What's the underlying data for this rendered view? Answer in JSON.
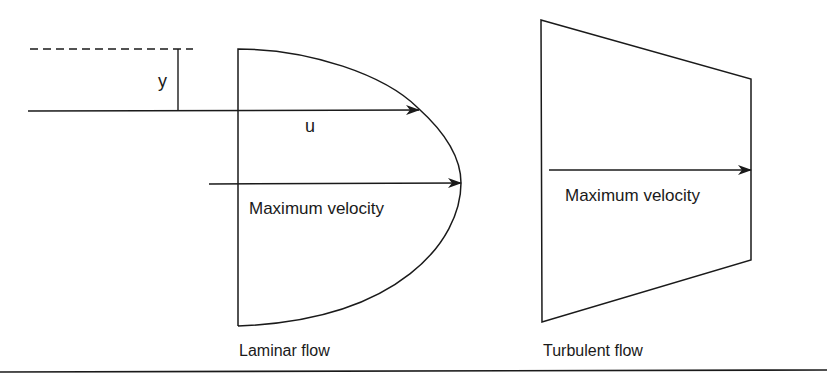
{
  "diagram": {
    "colors": {
      "stroke": "#1a1a1a",
      "background": "#ffffff"
    },
    "laminar": {
      "caption": "Laminar flow",
      "distance_label": "y",
      "velocity_label": "u",
      "max_velocity_label": "Maximum velocity"
    },
    "turbulent": {
      "caption": "Turbulent flow",
      "max_velocity_label": "Maximum velocity"
    }
  }
}
